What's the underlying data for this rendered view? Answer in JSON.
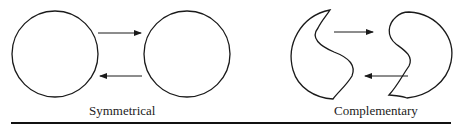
{
  "diagram": {
    "panels": [
      {
        "label": "Symmetrical",
        "shape": "circle"
      },
      {
        "label": "Complementary",
        "shape": "interlocking-crescent"
      }
    ],
    "arrows": [
      "left-to-right (top)",
      "right-to-left (bottom)"
    ],
    "colors": {
      "stroke": "#1a1a1a",
      "background": "#ffffff"
    }
  }
}
